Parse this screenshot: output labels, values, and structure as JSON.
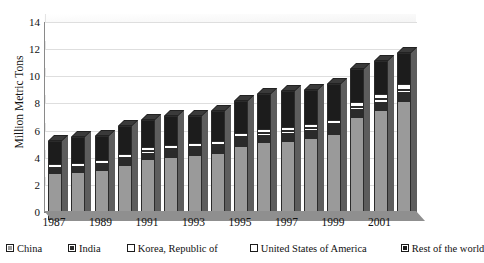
{
  "chart_data": {
    "type": "bar",
    "stacked": true,
    "title": "",
    "xlabel": "",
    "ylabel": "Million Metric Tons",
    "ylim": [
      0,
      14
    ],
    "ytick_values": [
      0,
      2,
      4,
      6,
      8,
      10,
      12,
      14
    ],
    "ytick_labels": [
      "0",
      "2",
      "4",
      "6",
      "8",
      "10",
      "12",
      "14"
    ],
    "grid": true,
    "legend_position": "bottom",
    "categories": [
      1987,
      1988,
      1989,
      1990,
      1991,
      1992,
      1993,
      1994,
      1995,
      1996,
      1997,
      1998,
      1999,
      2000,
      2001,
      2002
    ],
    "xtick_labels": [
      "1987",
      "1989",
      "1991",
      "1993",
      "1995",
      "1997",
      "1999",
      "2001"
    ],
    "series": [
      {
        "name": "China",
        "color": "#9a9a9a",
        "values": [
          3.4,
          3.45,
          3.6,
          3.95,
          4.4,
          4.6,
          4.75,
          4.9,
          5.4,
          5.65,
          5.75,
          5.95,
          6.3,
          7.5,
          8.0,
          8.7
        ]
      },
      {
        "name": "India",
        "color": "#2a2a2a",
        "values": [
          0.35,
          0.35,
          0.4,
          0.45,
          0.5,
          0.5,
          0.5,
          0.5,
          0.55,
          0.55,
          0.6,
          0.6,
          0.6,
          0.6,
          0.65,
          0.65
        ]
      },
      {
        "name": "Korea, Republic of",
        "color": "#ffffff",
        "values": [
          0.1,
          0.1,
          0.12,
          0.15,
          0.15,
          0.15,
          0.15,
          0.15,
          0.18,
          0.2,
          0.2,
          0.2,
          0.2,
          0.22,
          0.25,
          0.25
        ]
      },
      {
        "name": "United States of America",
        "color": "#ffffff",
        "values": [
          0.3,
          0.3,
          0.3,
          0.3,
          0.3,
          0.3,
          0.3,
          0.3,
          0.3,
          0.3,
          0.3,
          0.3,
          0.3,
          0.35,
          0.35,
          0.4
        ]
      },
      {
        "name": "Rest of the world",
        "color": "#1c1c1c",
        "values": [
          1.65,
          1.9,
          1.8,
          2.05,
          2.05,
          2.1,
          1.95,
          2.15,
          2.37,
          2.6,
          2.65,
          2.55,
          2.6,
          2.43,
          2.45,
          2.3
        ]
      }
    ],
    "totals": [
      5.8,
      6.1,
      6.22,
      6.9,
      7.4,
      7.65,
      7.65,
      8.0,
      8.8,
      9.3,
      9.5,
      9.6,
      10.0,
      11.1,
      11.7,
      12.3
    ]
  },
  "legend": {
    "items": [
      {
        "label": "China",
        "key": "china"
      },
      {
        "label": "India",
        "key": "india"
      },
      {
        "label": "Korea, Republic of",
        "key": "korea"
      },
      {
        "label": "United States of America",
        "key": "usa"
      },
      {
        "label": "Rest of the world",
        "key": "row"
      }
    ]
  }
}
